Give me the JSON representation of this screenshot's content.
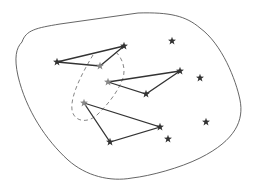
{
  "diagram": {
    "type": "point-set-triangles",
    "region_outline": {
      "stroke": "#555555"
    },
    "triangles": [
      {
        "id": "triangle-1",
        "vertices": [
          [
            57,
            62
          ],
          [
            124,
            46
          ],
          [
            100,
            66
          ]
        ]
      },
      {
        "id": "triangle-2",
        "vertices": [
          [
            108,
            82
          ],
          [
            180,
            71
          ],
          [
            146,
            94
          ]
        ]
      },
      {
        "id": "triangle-3",
        "vertices": [
          [
            84,
            103
          ],
          [
            160,
            127
          ],
          [
            110,
            142
          ]
        ]
      }
    ],
    "highlighted_vertices": [
      [
        100,
        66
      ],
      [
        108,
        82
      ],
      [
        84,
        103
      ]
    ],
    "lone_stars": [
      [
        172,
        41
      ],
      [
        200,
        78
      ],
      [
        206,
        122
      ],
      [
        168,
        139
      ]
    ],
    "colors": {
      "star": "#333333",
      "highlighted_star": "#888888",
      "edge": "#333333",
      "dashed_loop": "#777777"
    }
  }
}
